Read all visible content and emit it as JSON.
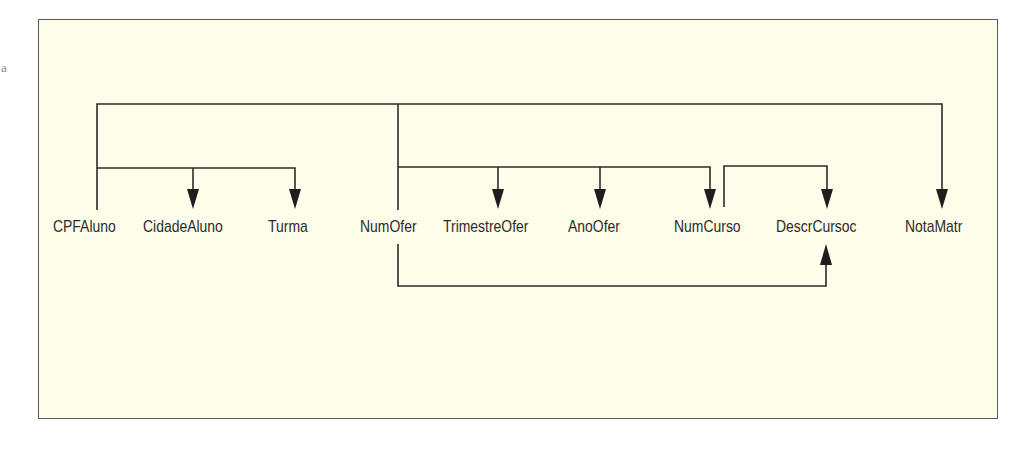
{
  "diagram": {
    "stray_mark": "a",
    "attributes": [
      {
        "id": "cpfaluno",
        "label": "CPFAluno",
        "x": 53
      },
      {
        "id": "cidadealuno",
        "label": "CidadeAluno",
        "x": 143
      },
      {
        "id": "turma",
        "label": "Turma",
        "x": 268
      },
      {
        "id": "numofer",
        "label": "NumOfer",
        "x": 360
      },
      {
        "id": "trimestreofer",
        "label": "TrimestreOfer",
        "x": 443
      },
      {
        "id": "anoofer",
        "label": "AnoOfer",
        "x": 568
      },
      {
        "id": "numcurso",
        "label": "NumCurso",
        "x": 674
      },
      {
        "id": "descrcursoc",
        "label": "DescrCursoc",
        "x": 776
      },
      {
        "id": "notamatr",
        "label": "NotaMatr",
        "x": 905
      }
    ],
    "dependencies": [
      {
        "from": [
          "CPFAluno",
          "NumOfer"
        ],
        "to": [
          "NotaMatr"
        ]
      },
      {
        "from": [
          "CPFAluno"
        ],
        "to": [
          "CidadeAluno",
          "Turma"
        ]
      },
      {
        "from": [
          "NumOfer"
        ],
        "to": [
          "TrimestreOfer",
          "AnoOfer",
          "NumCurso"
        ]
      },
      {
        "from": [
          "NumCurso"
        ],
        "to": [
          "DescrCursoc"
        ]
      },
      {
        "from": [
          "NumOfer"
        ],
        "to": [
          "DescrCursoc"
        ]
      }
    ],
    "colors": {
      "background": "#fefde9",
      "border": "#5a5a5a",
      "lines": "#2b2b2b"
    }
  }
}
